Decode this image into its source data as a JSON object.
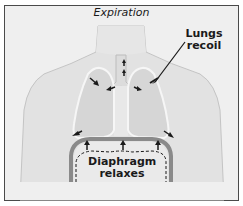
{
  "diagram": {
    "title": "Expiration",
    "labels": {
      "lungs": [
        "Lungs",
        "recoil"
      ],
      "diaphragm": [
        "Diaphragm",
        "relaxes"
      ]
    },
    "colors": {
      "background": "#efefef",
      "body": "#e2e2e2",
      "lungs": "#d6d6d6",
      "diaphragm": "#8a8a8a",
      "border": "#4a4a4a",
      "arrows": "#1a1a1a"
    }
  }
}
